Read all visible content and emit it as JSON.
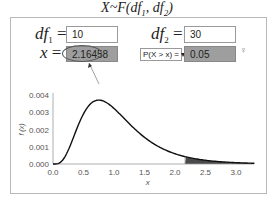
{
  "title": {
    "prefix": "X~F(df",
    "sub1": "1",
    "mid": ", df",
    "sub2": "2",
    "suffix": ")"
  },
  "inputs": {
    "df1": {
      "label": "df",
      "sub": "1",
      "eq": " =",
      "value": "10"
    },
    "df2": {
      "label": "df",
      "sub": "2",
      "eq": " =",
      "value": "30"
    },
    "x": {
      "label": "x",
      "eq": " =",
      "value": "2.16458"
    },
    "prob_type": {
      "selected": "P(X > x) = ▾"
    },
    "prob": {
      "value": "0.05"
    }
  },
  "icons": {
    "hint": "♀"
  },
  "colors": {
    "curve": "#111111",
    "shade": "#4a4a4a",
    "output_bg": "#9e9e9e",
    "axis": "#999999"
  },
  "chart_data": {
    "type": "line",
    "title": "",
    "xlabel": "x",
    "ylabel": "f (x)",
    "xlim": [
      0,
      3.3
    ],
    "ylim": [
      0,
      0.004
    ],
    "xticks": [
      "0.0",
      "0.5",
      "1.0",
      "1.5",
      "2.0",
      "2.5",
      "3.0"
    ],
    "yticks": [
      "0.000",
      "0.001",
      "0.002",
      "0.003",
      "0.004"
    ],
    "series": [
      {
        "name": "F(10,30) density (scaled)",
        "x": [
          0.0,
          0.1,
          0.2,
          0.3,
          0.4,
          0.5,
          0.6,
          0.7,
          0.75,
          0.8,
          0.9,
          1.0,
          1.2,
          1.4,
          1.6,
          1.8,
          2.0,
          2.2,
          2.4,
          2.6,
          2.8,
          3.0,
          3.3
        ],
        "y": [
          0.0,
          3e-05,
          0.00035,
          0.0012,
          0.0022,
          0.003,
          0.0035,
          0.00368,
          0.0037,
          0.00367,
          0.0035,
          0.0032,
          0.0025,
          0.0018,
          0.0013,
          0.0009,
          0.0006,
          0.00038,
          0.00024,
          0.00015,
          9e-05,
          5e-05,
          2e-05
        ]
      }
    ],
    "shaded_region": {
      "from": 2.16458,
      "to": 3.3,
      "area": 0.05
    },
    "grid": false
  }
}
